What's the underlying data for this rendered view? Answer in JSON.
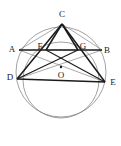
{
  "figure": {
    "type": "geometry-diagram",
    "canvas": {
      "width": 121,
      "height": 146
    },
    "colors": {
      "stroke_heavy": "#1a1a1a",
      "stroke_light": "#6f6f6f",
      "background": "#ffffff",
      "label": "#1a1a1a"
    },
    "labels": [
      {
        "id": "A",
        "text": "A",
        "x": 12,
        "y": 49
      },
      {
        "id": "C",
        "text": "C",
        "x": 62,
        "y": 14
      },
      {
        "id": "B",
        "text": "B",
        "x": 107,
        "y": 50
      },
      {
        "id": "F",
        "text": "F",
        "x": 40,
        "y": 46
      },
      {
        "id": "G",
        "text": "G",
        "x": 83,
        "y": 46
      },
      {
        "id": "D",
        "text": "D",
        "x": 10,
        "y": 77
      },
      {
        "id": "O",
        "text": "O",
        "x": 61,
        "y": 75
      },
      {
        "id": "E",
        "text": "E",
        "x": 113,
        "y": 82
      }
    ],
    "points": [
      {
        "id": "A",
        "x": 19,
        "y": 50
      },
      {
        "id": "B",
        "x": 102,
        "y": 50
      },
      {
        "id": "C",
        "x": 62,
        "y": 24
      },
      {
        "id": "D",
        "x": 17,
        "y": 79
      },
      {
        "id": "E",
        "x": 105,
        "y": 82
      },
      {
        "id": "F",
        "x": 46,
        "y": 50
      },
      {
        "id": "G",
        "x": 78,
        "y": 50
      },
      {
        "id": "O",
        "x": 61,
        "y": 67
      }
    ],
    "circles": [
      {
        "id": "circumcircle-CDE",
        "cx": 61,
        "cy": 72,
        "r": 45,
        "weight": "light"
      },
      {
        "id": "circle-O",
        "cx": 61,
        "cy": 80,
        "r": 38,
        "weight": "light"
      }
    ],
    "segments": [
      {
        "id": "AB",
        "from": "A",
        "to": "B",
        "weight": "heavy"
      },
      {
        "id": "CD",
        "from": "C",
        "to": "D",
        "weight": "heavy"
      },
      {
        "id": "CE",
        "from": "C",
        "to": "E",
        "weight": "heavy"
      },
      {
        "id": "DE",
        "from": "D",
        "to": "E",
        "weight": "heavy"
      },
      {
        "id": "DG",
        "from": "D",
        "to": "G",
        "weight": "heavy"
      },
      {
        "id": "FE",
        "from": "F",
        "to": "E",
        "weight": "heavy"
      },
      {
        "id": "CF",
        "from": "C",
        "to": "F",
        "weight": "heavy"
      },
      {
        "id": "CG",
        "from": "C",
        "to": "G",
        "weight": "heavy"
      },
      {
        "id": "AC",
        "from": "A",
        "to": "C",
        "weight": "light"
      },
      {
        "id": "CB",
        "from": "C",
        "to": "B",
        "weight": "light"
      },
      {
        "id": "DB",
        "from": "D",
        "to": "B",
        "weight": "light"
      },
      {
        "id": "AE",
        "from": "A",
        "to": "E",
        "weight": "light"
      },
      {
        "id": "FG",
        "from": "F",
        "to": "G",
        "weight": "light"
      }
    ],
    "center_dot": {
      "id": "O",
      "x": 61,
      "y": 67,
      "r": 1.2
    }
  }
}
